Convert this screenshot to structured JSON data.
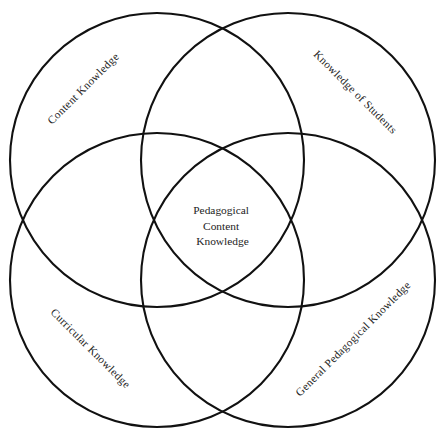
{
  "figure": {
    "name": "pedagogical-content-knowledge-venn-diagram",
    "type": "four-circle-venn-diagram",
    "background_color": "#ffffff",
    "stroke_color": "#111111",
    "text_color": "#232323"
  },
  "center": {
    "line1": "Pedagogical",
    "line2": "Content",
    "line3": "Knowledge"
  },
  "circles": {
    "top_left": {
      "label": "Content Knowledge",
      "cx": 157,
      "cy": 160,
      "r": 147,
      "label_angle": -45
    },
    "top_right": {
      "label": "Knowledge of Students",
      "cx": 288,
      "cy": 160,
      "r": 147,
      "label_angle": 45
    },
    "bottom_left": {
      "label": "Curricular Knowledge",
      "cx": 157,
      "cy": 280,
      "r": 147,
      "label_angle": 45
    },
    "bottom_right": {
      "label": "General Pedagogical Knowledge",
      "cx": 288,
      "cy": 280,
      "r": 147,
      "label_angle": -45
    }
  }
}
